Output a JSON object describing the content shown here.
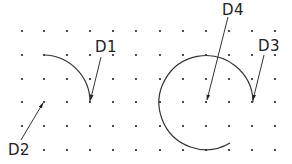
{
  "diagram": {
    "type": "arc-dimension-grid",
    "grid": {
      "columns_x": [
        22,
        44,
        67,
        90,
        113,
        136,
        160,
        183,
        206,
        229,
        252,
        275
      ],
      "rows_y": [
        31,
        55,
        79,
        102,
        126,
        150
      ],
      "dot_color": "#222222"
    },
    "line_color": "#333333",
    "labels": [
      {
        "id": "D1",
        "text": "D1"
      },
      {
        "id": "D2",
        "text": "D2"
      },
      {
        "id": "D3",
        "text": "D3"
      },
      {
        "id": "D4",
        "text": "D4"
      }
    ],
    "shapes": [
      {
        "name": "quarter-arc",
        "center": [
          44,
          102
        ],
        "radius": 47,
        "from": "top",
        "to": "right"
      },
      {
        "name": "three-quarter-arc",
        "center": [
          206,
          102
        ],
        "radius": 47,
        "from": "bottom-right-gap",
        "to": "right"
      }
    ]
  }
}
